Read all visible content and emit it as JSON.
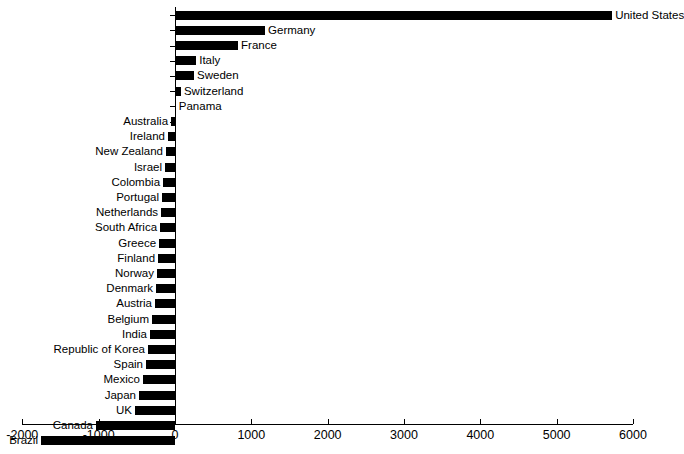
{
  "chart_data": {
    "type": "bar",
    "orientation": "horizontal",
    "title": "",
    "xlabel": "",
    "ylabel": "",
    "xlim": [
      -2000,
      6000
    ],
    "xticks": [
      -2000,
      -1000,
      0,
      1000,
      2000,
      3000,
      4000,
      5000,
      6000
    ],
    "xtick_labels": [
      "-2000",
      "-1000",
      "0",
      "1000",
      "2000",
      "3000",
      "4000",
      "5000",
      "6000"
    ],
    "grid": false,
    "legend": null,
    "bar_color": "#000000",
    "categories": [
      "United States",
      "Germany",
      "France",
      "Italy",
      "Sweden",
      "Switzerland",
      "Panama",
      "Australia",
      "Ireland",
      "New Zealand",
      "Israel",
      "Colombia",
      "Portugal",
      "Netherlands",
      "South Africa",
      "Greece",
      "Finland",
      "Norway",
      "Denmark",
      "Austria",
      "Belgium",
      "India",
      "Republic of Korea",
      "Spain",
      "Mexico",
      "Japan",
      "UK",
      "Canada",
      "Brazil"
    ],
    "values": [
      5727,
      1180,
      826,
      278,
      250,
      78,
      10,
      -52,
      -92,
      -118,
      -131,
      -157,
      -170,
      -183,
      -196,
      -209,
      -222,
      -236,
      -249,
      -262,
      -301,
      -328,
      -354,
      -380,
      -420,
      -472,
      -524,
      -1035,
      -1756
    ]
  }
}
